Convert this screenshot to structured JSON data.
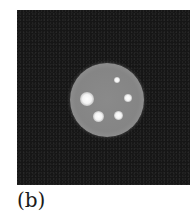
{
  "figure": {
    "panel_label": "(b)",
    "image": {
      "description": "grayscale reconstructed phantom image: noisy dark background with a bright circular disk containing five hot spots",
      "background_color": "#161616",
      "disk": {
        "cx": 107,
        "cy": 100,
        "r": 37,
        "color": "#8a8a8a"
      },
      "hot_spots": [
        {
          "name": "large-left",
          "cx": 87,
          "cy": 99,
          "r": 7
        },
        {
          "name": "small-top",
          "cx": 117,
          "cy": 80,
          "r": 3
        },
        {
          "name": "right",
          "cx": 128,
          "cy": 98,
          "r": 4
        },
        {
          "name": "bottom-left",
          "cx": 98,
          "cy": 116,
          "r": 5.5
        },
        {
          "name": "bottom-right",
          "cx": 118,
          "cy": 115,
          "r": 4.5
        }
      ]
    }
  }
}
